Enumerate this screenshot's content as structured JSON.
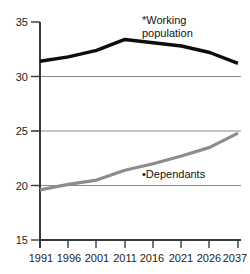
{
  "chart_data": {
    "type": "line",
    "title": "",
    "subtitle": "",
    "xlabel": "",
    "ylabel": "",
    "grid": true,
    "legend_position": "inline-annotations",
    "x": [
      1991,
      1996,
      2001,
      2011,
      2016,
      2021,
      2026,
      2037
    ],
    "xlim": [
      1991,
      2037
    ],
    "ylim": [
      15,
      35
    ],
    "yticks": [
      15,
      20,
      25,
      30,
      35
    ],
    "xticks": [
      1991,
      1996,
      2001,
      2011,
      2016,
      2021,
      2026,
      2037
    ],
    "xtick_labels": [
      "1991",
      "1996",
      "2001",
      "2011",
      "2016",
      "2021",
      "2026",
      "2037"
    ],
    "ytick_labels": [
      "35",
      "30",
      "25",
      "20",
      "15"
    ],
    "series": [
      {
        "name": "*Working population",
        "label": "*Working\npopulation",
        "color": "#0d0d0d",
        "values": [
          31.4,
          31.8,
          32.4,
          33.4,
          33.1,
          32.8,
          32.2,
          31.2
        ]
      },
      {
        "name": "•Dependants",
        "label": "•Dependants",
        "color": "#8c8c8c",
        "values": [
          19.6,
          20.1,
          20.5,
          21.4,
          22.0,
          22.7,
          23.5,
          24.8
        ]
      }
    ],
    "annotations": [
      {
        "text": "*Working",
        "series": "working-population"
      },
      {
        "text": "population",
        "series": "working-population"
      },
      {
        "text": "•Dependants",
        "series": "dependants"
      }
    ]
  },
  "labels": {
    "y": {
      "t35": "35",
      "t30": "30",
      "t25": "25",
      "t20": "20",
      "t15": "15"
    },
    "x": {
      "t1991": "1991",
      "t1996": "1996",
      "t2001": "2001",
      "t2011": "2011",
      "t2016": "2016",
      "t2021": "2021",
      "t2026": "2026",
      "t2037": "2037"
    },
    "series": {
      "working_line1": "*Working",
      "working_line2": "population",
      "dependants": "•Dependants"
    }
  },
  "colors": {
    "working": "#0d0d0d",
    "dependants": "#8c8c8c",
    "grid": "#8a8a8a",
    "axis": "#3a3a3a",
    "background": "#ffffff"
  }
}
